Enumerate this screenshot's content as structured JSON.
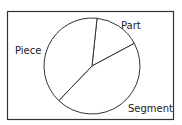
{
  "chart_data": {
    "type": "pie",
    "title": "",
    "categories": [
      "Part",
      "Segment",
      "Piece"
    ],
    "values": [
      15.5,
      45,
      39.5
    ],
    "unit": "percent (estimated from angles)",
    "start_angle_deg": 6,
    "direction": "clockwise",
    "legend": "none; direct labels outside slices",
    "colors": {
      "fill": "#ffffff",
      "stroke": "#333333",
      "frame": "#333333"
    }
  },
  "labels": {
    "part": "Part",
    "segment": "Segment",
    "piece": "Piece"
  }
}
